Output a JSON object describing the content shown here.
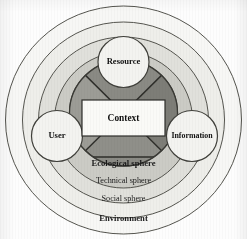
{
  "figure": {
    "type": "concentric-venn-diagram"
  },
  "colors": {
    "background": "#fdfdfd",
    "ring_environment_fill": "#f7f7f5",
    "ring_social_fill": "#efefec",
    "ring_technical_fill": "#e2e2de",
    "ring_ecological_fill": "#cfcfca",
    "inner_core_light": "#9a9a95",
    "inner_core_dark": "#75756f",
    "inner_core_bottom": "#83837d",
    "node_circle_fill": "#f4f4f1",
    "context_box_fill": "#fafaf7",
    "stroke": "#4a4a46",
    "text": "#111111"
  },
  "rings": [
    {
      "id": "environment",
      "label": "Environment",
      "bold": true,
      "label_x": 123.5,
      "label_y": 219,
      "rx": 118,
      "ry": 114
    },
    {
      "id": "social",
      "label": "Social  sphere",
      "bold": false,
      "label_x": 123.5,
      "label_y": 199,
      "rx": 101,
      "ry": 98
    },
    {
      "id": "technical",
      "label": "Technical sphere",
      "bold": false,
      "label_x": 123.5,
      "label_y": 181,
      "rx": 85,
      "ry": 83
    },
    {
      "id": "ecological",
      "label": "Ecological sphere",
      "bold": true,
      "label_x": 123.5,
      "label_y": 164,
      "rx": 69,
      "ry": 68
    }
  ],
  "core": {
    "id": "core-circle",
    "rx": 54,
    "ry": 53,
    "cx": 123.5,
    "cy": 113,
    "divider_y": 157
  },
  "nodes": [
    {
      "id": "resource",
      "label": "Resource",
      "cx": 123.5,
      "cy": 62,
      "r": 25.5,
      "font": "normal"
    },
    {
      "id": "user",
      "label": "User",
      "cx": 57,
      "cy": 136,
      "r": 25.5,
      "font": "normal"
    },
    {
      "id": "information",
      "label": "Information",
      "cx": 192,
      "cy": 136,
      "r": 25.5,
      "font": "small"
    }
  ],
  "center_box": {
    "id": "context-box",
    "label": "Context",
    "x": 82,
    "y": 100,
    "width": 83,
    "height": 36,
    "label_x": 123.5,
    "label_y": 118
  }
}
